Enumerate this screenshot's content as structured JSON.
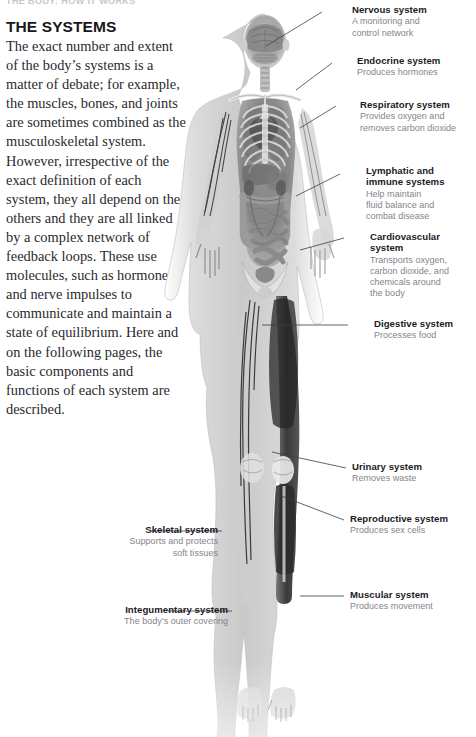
{
  "page": {
    "running_header": "THE BODY: HOW IT WORKS",
    "heading": "THE SYSTEMS",
    "body_text": "The exact number and extent of the body’s systems is a matter of debate; for example, the muscles, bones, and joints are sometimes combined as the musculoskeletal system. However, irrespective of the exact definition of each system, they all depend on the others and they are all linked by a complex network of feedback loops. These use molecules, such as hormones, and nerve impulses to communicate and maintain a state of equilibrium. Here and on the following pages, the basic components and functions of each system are described."
  },
  "figure": {
    "name": "human-body-anatomy-xray",
    "caption": "Grayscale x-ray style full-body anatomical figure, anterior view",
    "colors": {
      "skin": "#d9d9d9",
      "organ": "#8e8e8e",
      "muscle": "#3a3a3a",
      "bone": "#efefef",
      "vessel": "#2f2f2f",
      "line": "#4a4a4a"
    }
  },
  "labels_right": [
    {
      "title": "Nervous system",
      "desc": "A monitoring and\ncontrol network"
    },
    {
      "title": "Endocrine system",
      "desc": "Produces hormones"
    },
    {
      "title": "Respiratory system",
      "desc": "Provides oxygen and\nremoves carbon dioxide"
    },
    {
      "title": "Lymphatic and\nimmune systems",
      "desc": "Help maintain\nfluid balance and\ncombat disease"
    },
    {
      "title": "Cardiovascular system",
      "desc": "Transports oxygen,\ncarbon dioxide, and\nchemicals around\nthe body"
    },
    {
      "title": "Digestive system",
      "desc": "Processes food"
    },
    {
      "title": "Urinary system",
      "desc": "Removes waste"
    },
    {
      "title": "Reproductive system",
      "desc": "Produces sex cells"
    },
    {
      "title": "Muscular system",
      "desc": "Produces movement"
    }
  ],
  "labels_left": [
    {
      "title": "Skeletal system",
      "desc": "Supports and protects\nsoft tissues"
    },
    {
      "title": "Integumentary system",
      "desc": "The body’s outer covering"
    }
  ]
}
